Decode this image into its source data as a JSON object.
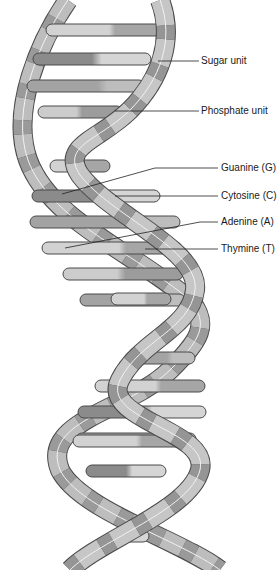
{
  "diagram": {
    "type": "dna-double-helix",
    "labels": [
      {
        "key": "sugar",
        "text": "Sugar unit",
        "x": 201,
        "y": 55
      },
      {
        "key": "phosphate",
        "text": "Phosphate unit",
        "x": 201,
        "y": 105
      },
      {
        "key": "guanine",
        "text": "Guanine (G)",
        "x": 221,
        "y": 162
      },
      {
        "key": "cytosine",
        "text": "Cytosine (C)",
        "x": 221,
        "y": 190
      },
      {
        "key": "adenine",
        "text": "Adenine (A)",
        "x": 221,
        "y": 216
      },
      {
        "key": "thymine",
        "text": "Thymine (T)",
        "x": 221,
        "y": 243
      }
    ],
    "colors": {
      "background": "#ffffff",
      "outline": "#4a4a4a",
      "strand_light": "#c9c9c9",
      "strand_mid": "#a8a8a8",
      "strand_dark": "#8a8a8a",
      "rung_light": "#cfcfcf",
      "rung_mid": "#a9a9a9",
      "rung_dark": "#8c8c8c",
      "leader_line": "#222222"
    }
  }
}
